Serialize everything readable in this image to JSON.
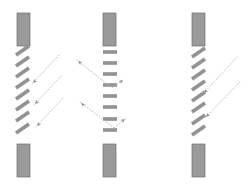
{
  "figure": {
    "title": "",
    "background_color": "#ffffff",
    "width": 248,
    "height": 190
  },
  "style": {
    "block_fill": "#9a9a9a",
    "block_stroke": "#6e6e6e",
    "slat_fill": "#a8a8a8",
    "slat_stroke": "#6b6b6b",
    "ray_color": "#b9b9b9",
    "ray_dash": "1 2",
    "ray_width": 0.9,
    "slat_stroke_width": 0.7,
    "block_stroke_width": 0.7
  },
  "panels": [
    {
      "id": "panel-left",
      "name": "left-louver-panel",
      "slat_orientation": "tilted-down-right",
      "slat_angle_deg": 45,
      "slat_count": 8,
      "top_block": {
        "x": 17,
        "y": 13,
        "w": 13,
        "h": 33
      },
      "bottom_block": {
        "x": 17,
        "y": 144,
        "w": 13,
        "h": 33
      },
      "slats": [
        {
          "x1": 16,
          "y1": 55,
          "x2": 29,
          "y2": 46
        },
        {
          "x1": 16,
          "y1": 66,
          "x2": 29,
          "y2": 57
        },
        {
          "x1": 16,
          "y1": 77,
          "x2": 29,
          "y2": 68
        },
        {
          "x1": 16,
          "y1": 88,
          "x2": 29,
          "y2": 79
        },
        {
          "x1": 16,
          "y1": 99,
          "x2": 29,
          "y2": 90
        },
        {
          "x1": 16,
          "y1": 110,
          "x2": 29,
          "y2": 101
        },
        {
          "x1": 16,
          "y1": 121,
          "x2": 29,
          "y2": 112
        },
        {
          "x1": 16,
          "y1": 133,
          "x2": 29,
          "y2": 124
        }
      ],
      "rays": [
        {
          "name": "incident-ray-1",
          "x1": 59,
          "y1": 55,
          "x2": 32,
          "y2": 84
        },
        {
          "name": "incident-ray-2",
          "x1": 61,
          "y1": 76,
          "x2": 34,
          "y2": 105
        },
        {
          "name": "incident-ray-3",
          "x1": 63,
          "y1": 98,
          "x2": 36,
          "y2": 127
        }
      ]
    },
    {
      "id": "panel-middle",
      "name": "middle-louver-panel",
      "slat_orientation": "horizontal",
      "slat_angle_deg": 0,
      "slat_count": 8,
      "top_block": {
        "x": 103,
        "y": 13,
        "w": 13,
        "h": 33
      },
      "bottom_block": {
        "x": 103,
        "y": 144,
        "w": 13,
        "h": 33
      },
      "slats": [
        {
          "x1": 103,
          "y1": 52,
          "x2": 117,
          "y2": 52
        },
        {
          "x1": 103,
          "y1": 63,
          "x2": 117,
          "y2": 63
        },
        {
          "x1": 103,
          "y1": 74,
          "x2": 117,
          "y2": 74
        },
        {
          "x1": 103,
          "y1": 85,
          "x2": 117,
          "y2": 85
        },
        {
          "x1": 103,
          "y1": 96,
          "x2": 117,
          "y2": 96
        },
        {
          "x1": 103,
          "y1": 107,
          "x2": 117,
          "y2": 107
        },
        {
          "x1": 103,
          "y1": 119,
          "x2": 117,
          "y2": 119
        },
        {
          "x1": 103,
          "y1": 130,
          "x2": 117,
          "y2": 130
        }
      ],
      "rays": [
        {
          "name": "incident-ray-1",
          "x1": 77,
          "y1": 60,
          "x2": 112,
          "y2": 88
        },
        {
          "name": "reflected-ray-1",
          "x1": 112,
          "y1": 88,
          "x2": 124,
          "y2": 79
        },
        {
          "name": "incident-ray-2",
          "x1": 80,
          "y1": 102,
          "x2": 114,
          "y2": 128
        },
        {
          "name": "reflected-ray-2",
          "x1": 114,
          "y1": 128,
          "x2": 126,
          "y2": 118
        }
      ]
    },
    {
      "id": "panel-right",
      "name": "right-louver-panel",
      "slat_orientation": "tilted-up-right",
      "slat_angle_deg": -45,
      "slat_count": 8,
      "top_block": {
        "x": 192,
        "y": 13,
        "w": 13,
        "h": 33
      },
      "bottom_block": {
        "x": 192,
        "y": 144,
        "w": 13,
        "h": 33
      },
      "slats": [
        {
          "x1": 192,
          "y1": 57,
          "x2": 205,
          "y2": 48
        },
        {
          "x1": 192,
          "y1": 68,
          "x2": 205,
          "y2": 59
        },
        {
          "x1": 192,
          "y1": 79,
          "x2": 205,
          "y2": 70
        },
        {
          "x1": 192,
          "y1": 90,
          "x2": 205,
          "y2": 81
        },
        {
          "x1": 192,
          "y1": 101,
          "x2": 205,
          "y2": 92
        },
        {
          "x1": 192,
          "y1": 112,
          "x2": 205,
          "y2": 103
        },
        {
          "x1": 192,
          "y1": 124,
          "x2": 205,
          "y2": 115
        },
        {
          "x1": 192,
          "y1": 135,
          "x2": 205,
          "y2": 126
        }
      ],
      "rays": [
        {
          "name": "incident-ray-1",
          "x1": 237,
          "y1": 57,
          "x2": 203,
          "y2": 94
        },
        {
          "name": "incident-ray-2",
          "x1": 240,
          "y1": 82,
          "x2": 205,
          "y2": 118
        }
      ]
    }
  ],
  "arrowheads": [
    {
      "panel": "panel-left",
      "name": "arrowhead-1",
      "x": 33,
      "y": 83,
      "angle": 133
    },
    {
      "panel": "panel-left",
      "name": "arrowhead-2",
      "x": 35,
      "y": 104,
      "angle": 133
    },
    {
      "panel": "panel-left",
      "name": "arrowhead-3",
      "x": 37,
      "y": 126,
      "angle": 133
    },
    {
      "panel": "panel-middle",
      "name": "arrowhead-1",
      "x": 78,
      "y": 61,
      "angle": 219
    },
    {
      "panel": "panel-middle",
      "name": "arrowhead-2",
      "x": 81,
      "y": 103,
      "angle": 219
    },
    {
      "panel": "panel-middle",
      "name": "arrowhead-3",
      "x": 123,
      "y": 80,
      "angle": 322
    },
    {
      "panel": "panel-middle",
      "name": "arrowhead-4",
      "x": 125,
      "y": 119,
      "angle": 322
    },
    {
      "panel": "panel-right",
      "name": "arrowhead-1",
      "x": 204,
      "y": 93,
      "angle": 133
    },
    {
      "panel": "panel-right",
      "name": "arrowhead-2",
      "x": 206,
      "y": 117,
      "angle": 133
    }
  ]
}
